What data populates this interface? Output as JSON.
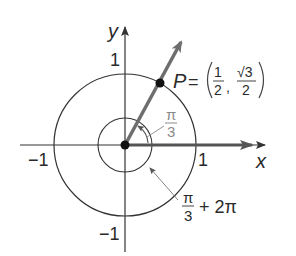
{
  "diagram": {
    "type": "unit-circle-angle",
    "axes": {
      "x_label": "x",
      "y_label": "y",
      "ticks": {
        "x_pos": "1",
        "x_neg": "−1",
        "y_pos": "1",
        "y_neg": "−1"
      }
    },
    "point": {
      "name": "P",
      "equals": "=",
      "x_num": "1",
      "x_den": "2",
      "y_num": "√3",
      "y_den": "2",
      "comma": ","
    },
    "angles": [
      {
        "label_num": "π",
        "label_den": "3",
        "suffix": ""
      },
      {
        "label_num": "π",
        "label_den": "3",
        "suffix": "+ 2π"
      }
    ],
    "colors": {
      "axis": "#333333",
      "circle": "#333333",
      "terminal_ray": "#6e6e6e",
      "initial_ray": "#555555",
      "point": "#111111",
      "angle_label": "#8a8a8a"
    }
  }
}
